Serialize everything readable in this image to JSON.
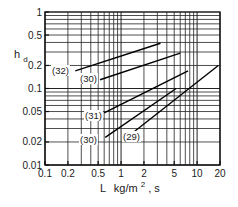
{
  "chart_data": {
    "type": "line",
    "title": "",
    "xlabel": "L kg/m², s",
    "ylabel": "h_d",
    "xscale": "log",
    "yscale": "log",
    "xlim": [
      0.1,
      20
    ],
    "ylim": [
      0.01,
      1
    ],
    "grid": true,
    "x_ticks": [
      "0.1",
      "0.2",
      "0.5",
      "1",
      "2",
      "5",
      "10",
      "20"
    ],
    "y_ticks": [
      "0.01",
      "0.02",
      "0.05",
      "0.1",
      "0.2",
      "0.5",
      "1"
    ],
    "series": [
      {
        "name": "(32)",
        "x": [
          0.25,
          3.3
        ],
        "y": [
          0.17,
          0.39
        ]
      },
      {
        "name": "(30)",
        "x": [
          0.53,
          6.0
        ],
        "y": [
          0.13,
          0.29
        ]
      },
      {
        "name": "(31)",
        "x": [
          0.6,
          7.6
        ],
        "y": [
          0.048,
          0.17
        ]
      },
      {
        "name": "(30)",
        "x": [
          0.62,
          5.3
        ],
        "y": [
          0.023,
          0.1
        ]
      },
      {
        "name": "(29)",
        "x": [
          1.4,
          19.0
        ],
        "y": [
          0.026,
          0.2
        ]
      }
    ],
    "series_label_positions": [
      {
        "text": "(32)",
        "x": 52,
        "y": 74
      },
      {
        "text": "(30)",
        "x": 80,
        "y": 82
      },
      {
        "text": "(31)",
        "x": 85,
        "y": 119
      },
      {
        "text": "(30)",
        "x": 80,
        "y": 143
      },
      {
        "text": "(29)",
        "x": 123,
        "y": 140
      }
    ]
  },
  "axes": {
    "x_label_main": "L",
    "x_label_units": "kg/m",
    "x_label_sup": "2",
    "x_label_tail": ", s",
    "y_label_main": "h",
    "y_label_sub": "d"
  }
}
